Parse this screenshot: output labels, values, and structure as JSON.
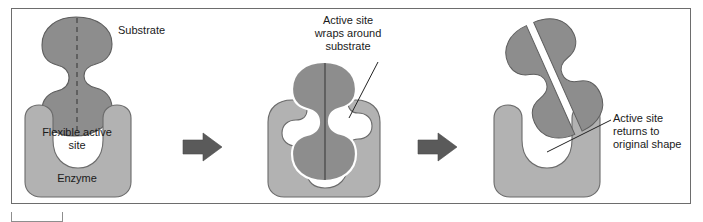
{
  "figure": {
    "panel_count": 3,
    "colors": {
      "background": "#ffffff",
      "frame_border": "#6d6d6d",
      "enzyme_fill": "#b2b2b2",
      "enzyme_outline": "#6b6b6b",
      "substrate_fill": "#8d8d8d",
      "substrate_outline": "#5e5e5e",
      "active_site_fill": "#ffffff",
      "arrow_fill": "#5a5a5a",
      "leader_line": "#222222",
      "text": "#1a1a1a"
    }
  },
  "panels": [
    {
      "id": "panel-1",
      "name": "substrate-approaches-enzyme",
      "labels": {
        "substrate": "Substrate",
        "flexible_active_site": "Flexible active\nsite",
        "enzyme": "Enzyme"
      },
      "shapes": {
        "substrate": "dumbbell-with-side-notches-dashed-midline",
        "enzyme": "u-shaped-block-with-rounded-corners",
        "active_site": "wide-u-cavity"
      }
    },
    {
      "id": "panel-2",
      "name": "active-site-wraps-substrate",
      "labels": {
        "callout": "Active site\nwraps around\nsubstrate"
      },
      "shapes": {
        "substrate": "substrate-seated-in-cavity-dashed-midline",
        "enzyme": "enzyme-conformed-around-substrate",
        "active_site": "contoured-cavity-matching-substrate"
      }
    },
    {
      "id": "panel-3",
      "name": "products-released-active-site-restored",
      "labels": {
        "callout": "Active site\nreturns to\noriginal shape"
      },
      "shapes": {
        "products": "two-substrate-halves-rotated-and-separated",
        "enzyme": "u-shaped-block-with-rounded-corners",
        "active_site": "wide-u-cavity"
      }
    }
  ],
  "arrows": [
    {
      "id": "arrow-1",
      "name": "process-arrow-1",
      "direction": "right"
    },
    {
      "id": "arrow-2",
      "name": "process-arrow-2",
      "direction": "right"
    }
  ],
  "callout_lines": [
    {
      "id": "leader-wraps",
      "from": "callout-wraps-around-substrate",
      "to": "panel-2-active-site-rim"
    },
    {
      "id": "leader-returns",
      "from": "callout-returns-to-original-shape",
      "to": "panel-3-active-site-cavity"
    }
  ]
}
